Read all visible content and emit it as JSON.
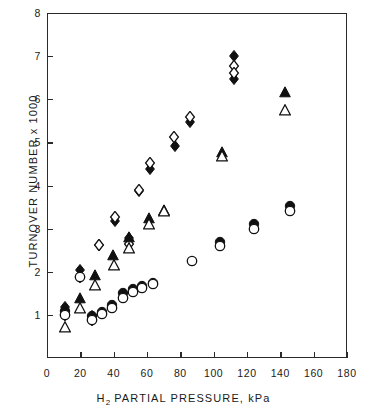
{
  "chart_data": {
    "type": "scatter",
    "title": "",
    "xlabel": "H₂ PARTIAL PRESSURE, kPa",
    "ylabel": "TURNOVER NUMBER x 1000",
    "xlim": [
      0,
      180
    ],
    "ylim": [
      0,
      8
    ],
    "xticks": [
      0,
      20,
      40,
      60,
      80,
      100,
      120,
      140,
      160,
      180
    ],
    "yticks": [
      1,
      2,
      3,
      4,
      5,
      6,
      7,
      8
    ],
    "xtick_labels": [
      "0",
      "20",
      "40",
      "60",
      "80",
      "100",
      "120",
      "140",
      "160",
      "180"
    ],
    "ytick_labels": [
      "1",
      "2",
      "3",
      "4",
      "5",
      "6",
      "7",
      "8"
    ],
    "grid": false,
    "legend": "none",
    "series": [
      {
        "name": "filled-diamond",
        "marker": "filled-diamond",
        "color": "#111111",
        "points": [
          [
            11,
            1.18
          ],
          [
            19.5,
            2.03
          ],
          [
            27,
            0.97
          ],
          [
            31,
            2.62
          ],
          [
            40.5,
            3.18
          ],
          [
            49,
            2.78
          ],
          [
            55,
            3.88
          ],
          [
            62,
            4.38
          ],
          [
            77,
            4.92
          ],
          [
            86,
            5.47
          ],
          [
            112,
            7.0
          ],
          [
            112,
            6.47
          ]
        ]
      },
      {
        "name": "open-diamond",
        "marker": "open-diamond",
        "color": "#111111",
        "points": [
          [
            11,
            1.0
          ],
          [
            19.5,
            1.88
          ],
          [
            27,
            0.88
          ],
          [
            31,
            2.63
          ],
          [
            41,
            3.27
          ],
          [
            49,
            2.64
          ],
          [
            55,
            3.9
          ],
          [
            62,
            4.52
          ],
          [
            76,
            5.12
          ],
          [
            86,
            5.58
          ],
          [
            112,
            6.78
          ],
          [
            112,
            6.62
          ]
        ]
      },
      {
        "name": "filled-triangle",
        "marker": "filled-triangle",
        "color": "#111111",
        "points": [
          [
            19.5,
            1.4
          ],
          [
            28.5,
            1.92
          ],
          [
            39.5,
            2.38
          ],
          [
            49,
            2.8
          ],
          [
            61,
            3.25
          ],
          [
            70,
            3.44
          ],
          [
            105,
            4.78
          ],
          [
            143,
            6.16
          ]
        ]
      },
      {
        "name": "open-triangle",
        "marker": "open-triangle",
        "color": "#111111",
        "points": [
          [
            11,
            0.72
          ],
          [
            19.5,
            1.15
          ],
          [
            28.5,
            1.7
          ],
          [
            40,
            2.15
          ],
          [
            49,
            2.55
          ],
          [
            61,
            3.1
          ],
          [
            70,
            3.4
          ],
          [
            105,
            4.68
          ],
          [
            143,
            5.75
          ]
        ]
      },
      {
        "name": "filled-circle",
        "marker": "filled-circle",
        "color": "#111111",
        "points": [
          [
            11,
            1.1
          ],
          [
            27,
            0.97
          ],
          [
            33,
            1.07
          ],
          [
            39,
            1.22
          ],
          [
            45.5,
            1.5
          ],
          [
            51.5,
            1.6
          ],
          [
            57,
            1.68
          ],
          [
            63.5,
            1.75
          ],
          [
            104,
            2.68
          ],
          [
            124,
            3.1
          ],
          [
            146,
            3.52
          ]
        ]
      },
      {
        "name": "open-circle",
        "marker": "open-circle",
        "color": "#111111",
        "points": [
          [
            11,
            1.0
          ],
          [
            19.5,
            1.88
          ],
          [
            27,
            0.88
          ],
          [
            33,
            1.03
          ],
          [
            39,
            1.17
          ],
          [
            45.5,
            1.4
          ],
          [
            51.5,
            1.53
          ],
          [
            57,
            1.62
          ],
          [
            63.5,
            1.72
          ],
          [
            87,
            2.26
          ],
          [
            104,
            2.6
          ],
          [
            124,
            2.98
          ],
          [
            146,
            3.4
          ]
        ]
      }
    ]
  }
}
